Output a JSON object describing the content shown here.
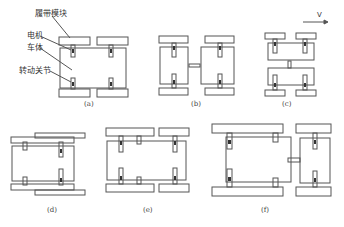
{
  "labels": {
    "track_module": "履带模块",
    "motor": "电机",
    "body": "车体",
    "joint": "转动关节",
    "velocity": "V"
  },
  "captions": {
    "a": "(a)",
    "b": "(b)",
    "c": "(c)",
    "d": "(d)",
    "e": "(e)",
    "f": "(f)"
  },
  "colors": {
    "stroke": "#555555",
    "background": "#ffffff"
  }
}
